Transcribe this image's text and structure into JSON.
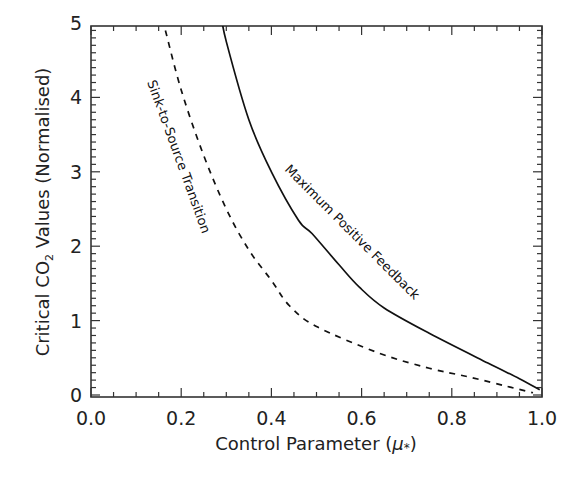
{
  "chart_data": {
    "type": "line",
    "title": "",
    "xlabel": "Control Parameter (μ*)",
    "ylabel": "Critical CO₂ Values (Normalised)",
    "xlim": [
      0.0,
      1.0
    ],
    "ylim": [
      -0.05,
      5.12
    ],
    "x_ticks": [
      0.0,
      0.2,
      0.4,
      0.6,
      0.8,
      1.0
    ],
    "x_tick_labels": [
      "0.0",
      "0.2",
      "0.4",
      "0.6",
      "0.8",
      "1.0"
    ],
    "y_ticks": [
      0,
      1,
      2,
      3,
      4,
      5
    ],
    "y_tick_labels": [
      "0",
      "1",
      "2",
      "3",
      "4",
      "5"
    ],
    "grid": false,
    "legend": null,
    "series": [
      {
        "name": "Maximum Positive Feedback",
        "style": "solid",
        "color": "#111111",
        "x": [
          0.288,
          0.3,
          0.35,
          0.4,
          0.46,
          0.49,
          0.55,
          0.595,
          0.65,
          0.75,
          0.88,
          0.95,
          0.995
        ],
        "y": [
          5.12,
          4.75,
          3.7,
          3.0,
          2.35,
          2.17,
          1.75,
          1.45,
          1.17,
          0.83,
          0.43,
          0.22,
          0.07
        ]
      },
      {
        "name": "Sink-to-Source Transition",
        "style": "dashed",
        "color": "#111111",
        "x": [
          0.165,
          0.2,
          0.248,
          0.3,
          0.35,
          0.4,
          0.44,
          0.5,
          0.64,
          0.75,
          0.84,
          0.92,
          0.98
        ],
        "y": [
          4.9,
          4.1,
          3.25,
          2.5,
          1.95,
          1.54,
          1.2,
          0.92,
          0.56,
          0.36,
          0.24,
          0.12,
          0.03
        ]
      }
    ],
    "annotations": [
      {
        "text": "Maximum Positive Feedback",
        "x": 0.43,
        "y": 3.05,
        "rotation": 45
      },
      {
        "text": "Sink-to-Source Transition",
        "x": 0.13,
        "y": 4.2,
        "rotation": 70
      }
    ]
  },
  "labels": {
    "xlabel_main": "Control Parameter (",
    "xlabel_mu": "μ",
    "xlabel_sub": "*",
    "xlabel_close": ")",
    "ylabel_pre": "Critical CO",
    "ylabel_sub": "2",
    "ylabel_post": " Values (Normalised)",
    "curve_solid": "Maximum Positive Feedback",
    "curve_dashed": "Sink-to-Source Transition"
  }
}
